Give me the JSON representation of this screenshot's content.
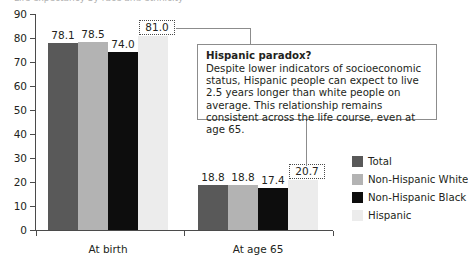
{
  "figure": {
    "cut_title_sliver": "Life expectancy by race and ethnicity",
    "callout": {
      "heading": "Hispanic paradox?",
      "body": "Despite lower indicators of socioeconomic status, Hispanic people can expect to live 2.5 years longer than white people on average. This relationship remains consistent across the life course, even at age 65."
    }
  },
  "chart_data": {
    "type": "bar",
    "title": "",
    "xlabel": "",
    "ylabel": "",
    "ylim": [
      0,
      90
    ],
    "yticks": [
      "0",
      "10",
      "20",
      "30",
      "40",
      "50",
      "60",
      "70",
      "80",
      "90"
    ],
    "grid": false,
    "legend_position": "right",
    "categories": [
      "At birth",
      "At age 65"
    ],
    "series": [
      {
        "name": "Total",
        "color": "#595959",
        "values": [
          78.1,
          18.8
        ],
        "highlight": false
      },
      {
        "name": "Non-Hispanic White",
        "color": "#b3b3b3",
        "values": [
          78.5,
          18.8
        ],
        "highlight": false
      },
      {
        "name": "Non-Hispanic Black",
        "color": "#0d0d0d",
        "values": [
          74.0,
          17.4
        ],
        "highlight": false
      },
      {
        "name": "Hispanic",
        "color": "#ececec",
        "values": [
          81.0,
          20.7
        ],
        "highlight": true
      }
    ],
    "value_labels": {
      "At birth": [
        "78.1",
        "78.5",
        "74.0",
        "81.0"
      ],
      "At age 65": [
        "18.8",
        "18.8",
        "17.4",
        "20.7"
      ]
    }
  },
  "legend": {
    "items": [
      {
        "label": "Total",
        "color": "#595959"
      },
      {
        "label": "Non-Hispanic White",
        "color": "#b3b3b3"
      },
      {
        "label": "Non-Hispanic Black",
        "color": "#0d0d0d"
      },
      {
        "label": "Hispanic",
        "color": "#ececec"
      }
    ]
  }
}
